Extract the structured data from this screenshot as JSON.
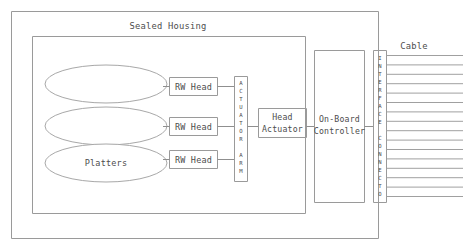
{
  "diagram": {
    "title": "Sealed Housing",
    "cable_label": "Cable",
    "platters_label": "Platters",
    "rw_heads": [
      {
        "label": "RW Head"
      },
      {
        "label": "RW Head"
      },
      {
        "label": "RW Head"
      }
    ],
    "actuator_arm": {
      "label": "ACTUATOR ARM",
      "chars": [
        "A",
        "C",
        "T",
        "U",
        "A",
        "T",
        "O",
        "R",
        "",
        "A",
        "R",
        "M"
      ]
    },
    "head_actuator": {
      "line1": "Head",
      "line2": "Actuator"
    },
    "controller": {
      "line1": "On-Board",
      "line2": "Controller"
    },
    "interface_connector": {
      "label": "INTERFACE CONNECTOR",
      "chars": [
        "I",
        "N",
        "T",
        "E",
        "R",
        "F",
        "A",
        "C",
        "E",
        "",
        "C",
        "O",
        "N",
        "N",
        "E",
        "C",
        "T",
        "O",
        "R"
      ]
    },
    "cable": {
      "line_count": 16
    },
    "colors": {
      "stroke": "#9a9a9a",
      "text": "#4d4d4d",
      "background": "#ffffff"
    }
  }
}
